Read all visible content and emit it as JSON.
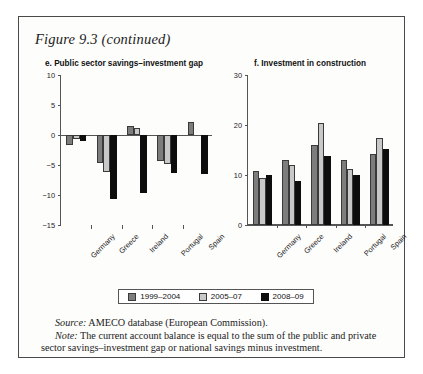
{
  "figure": {
    "title": "Figure 9.3 (continued)"
  },
  "legend": {
    "items": [
      {
        "label": "1999–2004",
        "color": "#7d7d7d"
      },
      {
        "label": "2005–07",
        "color": "#c8c8c8"
      },
      {
        "label": "2008–09",
        "color": "#0d0d0d"
      }
    ]
  },
  "notes": {
    "source_label": "Source:",
    "source_text": " AMECO database (European Commission).",
    "note_label": "Note:",
    "note_text": " The current account balance is equal to the sum of the public and private sector savings–investment gap or national savings minus investment."
  },
  "chart_data": [
    {
      "type": "bar",
      "panel": "e",
      "title": "e. Public sector savings–investment gap",
      "categories": [
        "Germany",
        "Greece",
        "Ireland",
        "Portugal",
        "Spain"
      ],
      "series": [
        {
          "name": "1999–2004",
          "values": [
            -1.7,
            -4.7,
            1.5,
            -4.3,
            2.2
          ]
        },
        {
          "name": "2005–07",
          "values": [
            -0.7,
            -6.2,
            1.1,
            -4.9,
            0.0
          ]
        },
        {
          "name": "2008–09",
          "values": [
            -1.0,
            -10.7,
            -9.7,
            -6.4,
            -6.5
          ]
        }
      ],
      "ylim": [
        -15,
        10
      ],
      "yticks": [
        10,
        5,
        0,
        -5,
        -10,
        -15
      ],
      "ytick_labels": [
        "10",
        "5",
        "0",
        "−5",
        "−10",
        "−15"
      ],
      "xlabel": "",
      "ylabel": "",
      "grid": false,
      "legend_position": "bottom-shared"
    },
    {
      "type": "bar",
      "panel": "f",
      "title": "f. Investment in construction",
      "categories": [
        "Germany",
        "Greece",
        "Ireland",
        "Portugal",
        "Spain"
      ],
      "series": [
        {
          "name": "1999–2004",
          "values": [
            10.9,
            13.1,
            16.0,
            13.1,
            14.2
          ]
        },
        {
          "name": "2005–07",
          "values": [
            9.4,
            12.0,
            20.5,
            11.2,
            17.4
          ]
        },
        {
          "name": "2008–09",
          "values": [
            10.1,
            8.9,
            13.8,
            10.1,
            15.3
          ]
        }
      ],
      "ylim": [
        0,
        30
      ],
      "yticks": [
        30,
        20,
        10,
        0
      ],
      "ytick_labels": [
        "30",
        "20",
        "10",
        "0"
      ],
      "xlabel": "",
      "ylabel": "",
      "grid": false,
      "legend_position": "bottom-shared"
    }
  ]
}
